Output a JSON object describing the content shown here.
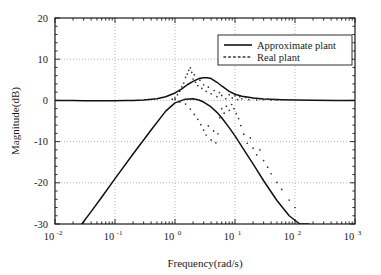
{
  "chart_data": {
    "type": "line",
    "title": "",
    "xlabel": "Frequency(rad/s)",
    "ylabel": "Magnitude(dB)",
    "xscale": "log",
    "xlim": [
      0.01,
      1000
    ],
    "ylim": [
      -30,
      20
    ],
    "yticks": [
      20,
      10,
      0,
      -10,
      -20,
      -30
    ],
    "ytick_labels": [
      "20",
      "10",
      "0",
      "-10",
      "-20",
      "-30"
    ],
    "xticks": [
      0.01,
      0.1,
      1,
      10,
      100,
      1000
    ],
    "xtick_labels": [
      "10-2",
      "10-1",
      "100",
      "101",
      "102",
      "103"
    ],
    "xtick_mantissa": "10",
    "xtick_exponents": [
      "-2",
      "-1",
      "0",
      "1",
      "2",
      "3"
    ],
    "grid": true,
    "grid_style": "dotted",
    "legend_position": "upper-right",
    "series": [
      {
        "name": "Approximate plant",
        "style": "solid",
        "color": "#111111",
        "x": [
          0.01,
          0.02,
          0.03,
          0.05,
          0.08,
          0.1,
          0.15,
          0.2,
          0.3,
          0.5,
          0.7,
          1.0,
          1.3,
          1.6,
          2.0,
          2.5,
          3.0,
          3.5,
          4.0,
          5.0,
          6.0,
          8.0,
          10.0,
          13.0,
          16.0,
          20.0,
          25.0,
          30.0,
          40.0,
          60.0,
          100.0,
          200.0,
          500.0,
          1000.0
        ],
        "y": [
          -0.02,
          -0.05,
          -0.08,
          -0.1,
          -0.1,
          -0.1,
          -0.05,
          0.0,
          0.1,
          0.4,
          0.9,
          1.8,
          2.8,
          3.8,
          4.6,
          5.3,
          5.5,
          5.5,
          5.3,
          4.4,
          3.5,
          2.2,
          1.5,
          1.0,
          0.8,
          0.6,
          0.45,
          0.35,
          0.25,
          0.15,
          0.08,
          0.03,
          0.0,
          0.0
        ]
      },
      {
        "name": "Approximate plant (second branch)",
        "style": "solid",
        "color": "#111111",
        "x": [
          0.01,
          0.02,
          0.028,
          0.04,
          0.06,
          0.1,
          0.2,
          0.4,
          0.7,
          1.0,
          1.5,
          2.0,
          2.5,
          3.0,
          4.0,
          5.0,
          6.0,
          8.0,
          10.0,
          15.0,
          20.0,
          30.0,
          50.0,
          80.0,
          120.0,
          170.0,
          200.0
        ],
        "y": [
          -39.0,
          -33.0,
          -30.0,
          -27.0,
          -23.5,
          -19.0,
          -13.0,
          -7.2,
          -2.6,
          -0.6,
          0.3,
          0.4,
          0.1,
          -0.4,
          -1.6,
          -2.9,
          -4.2,
          -6.6,
          -8.6,
          -12.6,
          -15.4,
          -19.5,
          -24.3,
          -28.0,
          -30.0,
          -30.0,
          -33.0
        ]
      },
      {
        "name": "Real plant",
        "style": "dotted",
        "color": "#333333",
        "x": [
          0.9,
          1.0,
          1.1,
          1.2,
          1.3,
          1.4,
          1.5,
          1.6,
          1.7,
          1.8,
          1.9,
          2.0,
          2.1,
          2.2,
          2.4,
          2.6,
          2.8,
          3.0,
          3.3,
          3.6,
          4.0,
          4.5,
          5.0,
          5.5,
          6.0,
          7.0,
          8.0,
          9.0,
          10.0,
          11.0,
          12.0,
          13.0,
          15.0,
          17.0,
          20.0,
          23.0,
          26.0,
          30.0,
          35.0,
          40.0,
          45.0,
          50.0
        ],
        "y": [
          0.3,
          0.6,
          1.4,
          2.2,
          3.3,
          4.2,
          5.6,
          6.4,
          7.3,
          7.9,
          6.8,
          5.2,
          6.2,
          4.4,
          3.6,
          4.9,
          2.9,
          3.8,
          2.2,
          3.2,
          1.6,
          2.4,
          0.9,
          1.9,
          1.2,
          0.4,
          1.4,
          0.6,
          1.1,
          0.2,
          0.9,
          0.4,
          0.7,
          0.2,
          0.5,
          0.1,
          0.4,
          0.2,
          0.3,
          0.1,
          0.2,
          0.1
        ]
      },
      {
        "name": "Real plant (lower scatter)",
        "style": "dotted",
        "color": "#333333",
        "x": [
          1.0,
          1.2,
          1.5,
          1.8,
          2.1,
          2.4,
          2.7,
          3.0,
          3.3,
          3.6,
          4.0,
          4.4,
          4.8,
          5.2,
          5.6,
          6.0,
          6.6,
          7.2,
          8.0,
          8.8,
          9.6,
          10.5,
          11.5,
          12.5,
          14.0,
          16.0,
          18.0,
          20.0,
          23.0,
          26.0,
          30.0,
          35.0,
          40.0,
          50.0,
          60.0,
          80.0,
          100.0
        ],
        "y": [
          0.2,
          -0.4,
          -0.9,
          -2.1,
          -3.4,
          -4.6,
          -5.9,
          -7.2,
          -8.4,
          -6.2,
          -9.6,
          -7.4,
          -10.3,
          -8.1,
          -4.2,
          -2.0,
          -3.1,
          -1.4,
          -2.4,
          -1.0,
          -2.0,
          -3.2,
          -4.4,
          -6.1,
          -8.2,
          -10.4,
          -9.1,
          -11.6,
          -13.2,
          -12.0,
          -14.6,
          -16.2,
          -17.8,
          -19.9,
          -21.6,
          -24.2,
          -26.0
        ]
      }
    ],
    "legend_entries": [
      {
        "label": "Approximate plant",
        "style": "solid"
      },
      {
        "label": "Real plant",
        "style": "dotted"
      }
    ]
  },
  "axes": {
    "y_axis_title": "Magnitude(dB)",
    "x_axis_title": "Frequency(rad/s)"
  },
  "legend": {
    "approximate_label": "Approximate plant",
    "real_label": "Real plant"
  }
}
